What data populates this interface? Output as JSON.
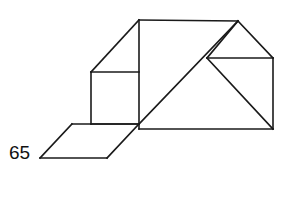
{
  "figure": {
    "background_color": "#ffffff",
    "stroke_color": "#1a1a1a",
    "stroke_width": 1.6,
    "labels": [
      {
        "name": "angle-label-65",
        "text": "65",
        "x": 9,
        "y": 143,
        "font_size": 19,
        "color": "#111111"
      }
    ],
    "vertices": {
      "apex_left": [
        139,
        20
      ],
      "apex_right": [
        238,
        21
      ],
      "upper_left_shoulder": [
        91,
        72
      ],
      "square_top_right": [
        139,
        72
      ],
      "square_bottom_left": [
        91,
        124
      ],
      "square_bottom_right": [
        139,
        124
      ],
      "right_inner_left": [
        207,
        58
      ],
      "right_inner_right": [
        273,
        58
      ],
      "bottom_right": [
        273,
        129
      ],
      "bottom_mid_left": [
        139,
        129
      ],
      "para_left": [
        40,
        158
      ],
      "para_top_left": [
        72,
        124
      ],
      "para_bottom_right": [
        107,
        158
      ],
      "para_top_right": [
        139,
        124
      ]
    },
    "segments": [
      {
        "name": "ridge-top-edge",
        "x1": 139,
        "y1": 20,
        "x2": 238,
        "y2": 21
      },
      {
        "name": "left-roof-slope",
        "x1": 139,
        "y1": 20,
        "x2": 91,
        "y2": 72
      },
      {
        "name": "left-vertical-edge",
        "x1": 91,
        "y1": 72,
        "x2": 91,
        "y2": 124
      },
      {
        "name": "square-top-horizontal",
        "x1": 91,
        "y1": 72,
        "x2": 139,
        "y2": 72
      },
      {
        "name": "center-vertical-edge",
        "x1": 139,
        "y1": 20,
        "x2": 139,
        "y2": 124
      },
      {
        "name": "square-bottom-horizontal",
        "x1": 91,
        "y1": 124,
        "x2": 139,
        "y2": 124
      },
      {
        "name": "right-roof-slope",
        "x1": 238,
        "y1": 21,
        "x2": 273,
        "y2": 58
      },
      {
        "name": "right-inner-slope",
        "x1": 238,
        "y1": 21,
        "x2": 207,
        "y2": 58
      },
      {
        "name": "right-inner-horizontal",
        "x1": 207,
        "y1": 58,
        "x2": 273,
        "y2": 58
      },
      {
        "name": "right-vertical-edge",
        "x1": 273,
        "y1": 58,
        "x2": 273,
        "y2": 129
      },
      {
        "name": "right-diagonal-brace",
        "x1": 207,
        "y1": 58,
        "x2": 273,
        "y2": 129
      },
      {
        "name": "long-diagonal",
        "x1": 238,
        "y1": 21,
        "x2": 139,
        "y2": 124
      },
      {
        "name": "lower-long-diagonal",
        "x1": 139,
        "y1": 124,
        "x2": 107,
        "y2": 158
      },
      {
        "name": "bottom-horizontal-edge",
        "x1": 139,
        "y1": 129,
        "x2": 273,
        "y2": 129
      },
      {
        "name": "bottom-edge-to-center",
        "x1": 139,
        "y1": 124,
        "x2": 139,
        "y2": 129
      },
      {
        "name": "parallelogram-top-edge",
        "x1": 72,
        "y1": 124,
        "x2": 139,
        "y2": 124
      },
      {
        "name": "parallelogram-left-slope",
        "x1": 72,
        "y1": 124,
        "x2": 40,
        "y2": 158
      },
      {
        "name": "parallelogram-bottom-edge",
        "x1": 40,
        "y1": 158,
        "x2": 107,
        "y2": 158
      }
    ]
  }
}
